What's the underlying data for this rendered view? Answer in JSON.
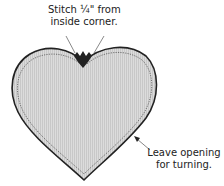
{
  "diagram": {
    "annotations": {
      "top": {
        "line1": "Stitch ¼\" from",
        "line2": "inside corner."
      },
      "right": {
        "line1": "Leave opening",
        "line2": "for turning."
      }
    },
    "colors": {
      "fill": "#d4d4d4",
      "outline": "#222222",
      "stitch": "#444444",
      "text": "#222222"
    }
  }
}
